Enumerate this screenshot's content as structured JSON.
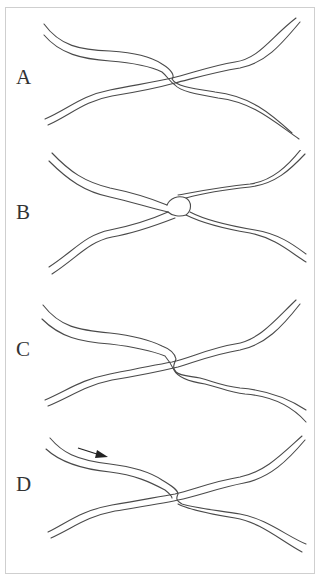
{
  "figure": {
    "panels": [
      {
        "label": "A",
        "junction": "strands cross with top strand looping over at center"
      },
      {
        "label": "B",
        "junction": "strands pinched together into a knot-like junction"
      },
      {
        "label": "C",
        "junction": "strands cross with offset hook at center"
      },
      {
        "label": "D",
        "junction": "strands cross; arrow indicates direction of movement",
        "arrow": true
      }
    ],
    "colors": {
      "line": "#4a4a4a",
      "border": "#cfcfcf",
      "background": "#ffffff"
    }
  }
}
